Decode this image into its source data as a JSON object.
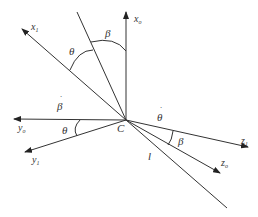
{
  "diagram": {
    "type": "coordinate-frame",
    "origin_label": "C",
    "axes": [
      {
        "id": "x_o",
        "label": "x",
        "subscript": "o"
      },
      {
        "id": "x_1",
        "label": "x",
        "subscript": "1"
      },
      {
        "id": "y_o",
        "label": "y",
        "subscript": "o"
      },
      {
        "id": "y_1",
        "label": "y",
        "subscript": "1"
      },
      {
        "id": "z_o",
        "label": "z",
        "subscript": "o"
      },
      {
        "id": "z_1",
        "label": "z",
        "subscript": "1"
      }
    ],
    "line_label": "l",
    "angles": {
      "theta_top": "θ",
      "beta_top": "β",
      "theta_left": "θ",
      "beta_right": "β"
    },
    "rates": {
      "beta_dot": "β",
      "theta_dot": "θ",
      "dot": "˙"
    },
    "colors": {
      "line": "#333333",
      "background": "#ffffff"
    }
  }
}
